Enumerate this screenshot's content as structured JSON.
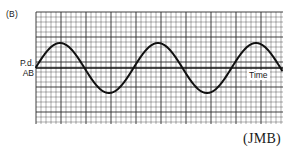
{
  "figure": {
    "panel_label": "(B)",
    "y_axis_label_line1": "P.d.",
    "y_axis_label_line2": "AB",
    "x_axis_label": "Time",
    "source": "(JMB)"
  },
  "graph": {
    "left": 36,
    "top": 12,
    "right": 283,
    "bottom": 124,
    "axis_y": 68,
    "minor_step": 5,
    "major_every": 5,
    "grid_color": "#2a2a2a",
    "wave_color": "#111111"
  },
  "wave": {
    "type": "sine",
    "start_x": 36,
    "end_x": 282,
    "baseline_y": 68,
    "amplitude_px": 25,
    "period_px": 98,
    "phase": "starts near zero crossing rising, peaks at x≈60, 158, 256; troughs at x≈110, 208",
    "cycles_shown": 2.5
  }
}
